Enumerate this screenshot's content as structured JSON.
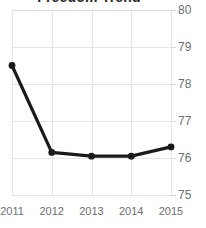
{
  "chart_data": {
    "type": "line",
    "title": "Freedom Trend",
    "title_clipped": true,
    "xlabel": "",
    "ylabel": "",
    "categories": [
      "2011",
      "2012",
      "2013",
      "2014",
      "2015"
    ],
    "x": [
      2011,
      2012,
      2013,
      2014,
      2015
    ],
    "values": [
      78.5,
      76.15,
      76.05,
      76.05,
      76.3
    ],
    "series": [
      {
        "name": "Score",
        "values": [
          78.5,
          76.15,
          76.05,
          76.05,
          76.3
        ]
      }
    ],
    "ylim": [
      75,
      80
    ],
    "yticks": [
      75,
      76,
      77,
      78,
      79,
      80
    ],
    "ytick_labels": [
      "75",
      "76",
      "77",
      "78",
      "79",
      "80"
    ],
    "xtick_labels": [
      "2011",
      "2012",
      "2013",
      "2014",
      "2015"
    ],
    "y_axis_position": "right",
    "grid": true,
    "grid_axis": "both",
    "legend": false,
    "legend_position": "none",
    "markers": true,
    "colors": {
      "line": "#1a1a1a",
      "marker": "#1a1a1a",
      "grid": "#e3e6e8",
      "tick_label": "#6b6f72",
      "title": "#262626",
      "background": "#ffffff"
    }
  }
}
